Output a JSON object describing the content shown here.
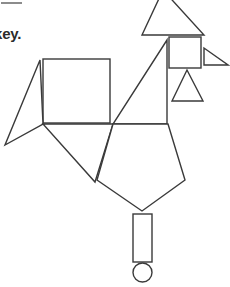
{
  "page": {
    "width": 230,
    "height": 287,
    "background_color": "#ffffff",
    "caption_text": "key.",
    "rule_color": "#8c8c8c"
  },
  "figure": {
    "name": "tangram-bird-figure",
    "stroke_color": "#3a3a3a",
    "fill_color": "#ffffff",
    "stroke_width": 1.4,
    "shapes": [
      {
        "name": "top-triangle",
        "type": "polygon",
        "points": "163,-10 204,35 142,35"
      },
      {
        "name": "head-square",
        "type": "rect",
        "x": 169,
        "y": 37,
        "width": 32,
        "height": 31
      },
      {
        "name": "beak-right-triangle",
        "type": "polygon",
        "points": "204,48 204,65 228,65"
      },
      {
        "name": "small-isosceles-triangle",
        "type": "polygon",
        "points": "187,70 203,101 172,101"
      },
      {
        "name": "neck-right-triangle",
        "type": "polygon",
        "points": "167,40 167,124 113,124"
      },
      {
        "name": "body-square",
        "type": "rect",
        "x": 43,
        "y": 59,
        "width": 67,
        "height": 64
      },
      {
        "name": "left-wing-thin-triangle",
        "type": "polygon",
        "points": "40,60 43,124 5,145"
      },
      {
        "name": "lower-left-triangle",
        "type": "polygon",
        "points": "43,124 113,124 95,182"
      },
      {
        "name": "pentagon-body",
        "type": "polygon",
        "points": "113,124 168,124 185,180 142,211 97,180"
      },
      {
        "name": "leg-rectangle",
        "type": "rect",
        "x": 133,
        "y": 214,
        "width": 19,
        "height": 48
      },
      {
        "name": "foot-circle",
        "type": "circle",
        "cx": 142.5,
        "cy": 272.5,
        "r": 9.5
      }
    ]
  }
}
